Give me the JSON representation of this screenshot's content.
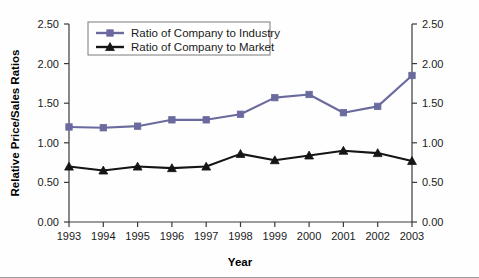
{
  "chart_data": {
    "type": "line",
    "title": "",
    "xlabel": "Year",
    "ylabel": "Relative Price/Sales Ratios",
    "ylabel_right": "",
    "categories": [
      "1993",
      "1994",
      "1995",
      "1996",
      "1997",
      "1998",
      "1999",
      "2000",
      "2001",
      "2002",
      "2003"
    ],
    "x": [
      1993,
      1994,
      1995,
      1996,
      1997,
      1998,
      1999,
      2000,
      2001,
      2002,
      2003
    ],
    "ylim": [
      0.0,
      2.5
    ],
    "xlim": [
      1993,
      2003
    ],
    "yticks": [
      "0.00",
      "0.50",
      "1.00",
      "1.50",
      "2.00",
      "2.50"
    ],
    "ytick_values": [
      0.0,
      0.5,
      1.0,
      1.5,
      2.0,
      2.5
    ],
    "yticks_right": [
      "0.00",
      "0.50",
      "1.00",
      "1.50",
      "2.00",
      "2.50"
    ],
    "grid": false,
    "legend_position": "top-center",
    "series": [
      {
        "name": "Ratio of Company to Industry",
        "color": "#6a6a9e",
        "marker": "square",
        "values": [
          1.2,
          1.19,
          1.21,
          1.29,
          1.29,
          1.36,
          1.57,
          1.61,
          1.38,
          1.46,
          1.85
        ]
      },
      {
        "name": "Ratio of Company to Market",
        "color": "#151515",
        "marker": "triangle",
        "values": [
          0.7,
          0.65,
          0.7,
          0.68,
          0.7,
          0.86,
          0.78,
          0.84,
          0.9,
          0.87,
          0.77
        ]
      }
    ]
  },
  "legend": {
    "entries": [
      {
        "label": "Ratio of Company to Industry"
      },
      {
        "label": "Ratio of Company to Market"
      }
    ]
  },
  "axes": {
    "x_title": "Year",
    "y_title": "Relative Price/Sales Ratios"
  }
}
